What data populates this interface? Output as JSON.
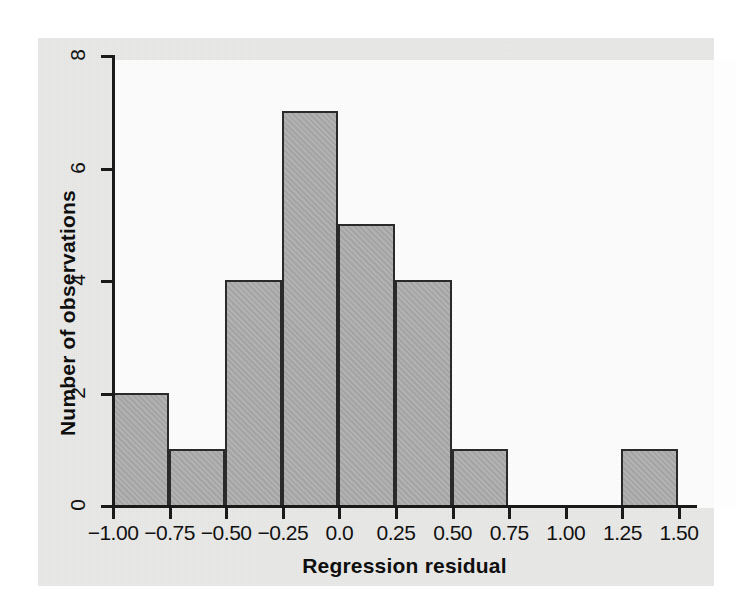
{
  "figure": {
    "background_color": "#e9e9e7",
    "plot_background_color": "#fdfdfd",
    "bar_fill_color": "#a9a9a9",
    "bar_edge_color": "#2a2a2a",
    "axis_color": "#1a1a1a"
  },
  "axes": {
    "x_title": "Regression residual",
    "y_title": "Number of observations",
    "x_tick_labels": [
      "−1.00",
      "−0.75",
      "−0.50",
      "−0.25",
      "0.0",
      "0.25",
      "0.50",
      "0.75",
      "1.00",
      "1.25",
      "1.50"
    ],
    "y_tick_labels": [
      "0",
      "2",
      "4",
      "6",
      "8"
    ]
  },
  "chart_data": {
    "type": "bar",
    "chart_subtype": "histogram",
    "title": "",
    "subtitle": "",
    "xlabel": "Regression residual",
    "ylabel": "Number of observations",
    "xlim": [
      -1.0,
      1.5
    ],
    "ylim": [
      0,
      8
    ],
    "xticks": [
      -1.0,
      -0.75,
      -0.5,
      -0.25,
      0.0,
      0.25,
      0.5,
      0.75,
      1.0,
      1.25,
      1.5
    ],
    "xtick_labels": [
      "−1.00",
      "−0.75",
      "−0.50",
      "−0.25",
      "0.0",
      "0.25",
      "0.50",
      "0.75",
      "1.00",
      "1.25",
      "1.50"
    ],
    "yticks": [
      0,
      2,
      4,
      6,
      8
    ],
    "ytick_labels": [
      "0",
      "2",
      "4",
      "6",
      "8"
    ],
    "grid": false,
    "legend": null,
    "bin_width": 0.25,
    "bin_edges": [
      -1.0,
      -0.75,
      -0.5,
      -0.25,
      0.0,
      0.25,
      0.5,
      0.75,
      1.0,
      1.25,
      1.5
    ],
    "categories": [
      "[-1.00, -0.75)",
      "[-0.75, -0.50)",
      "[-0.50, -0.25)",
      "[-0.25, 0.00)",
      "[0.00, 0.25)",
      "[0.25, 0.50)",
      "[0.50, 0.75)",
      "[0.75, 1.00)",
      "[1.00, 1.25)",
      "[1.25, 1.50)"
    ],
    "values": [
      2,
      1,
      4,
      7,
      5,
      4,
      1,
      0,
      0,
      1
    ],
    "total_observations": 25,
    "bars": [
      {
        "bin_start": -1.0,
        "bin_end": -0.75,
        "count": 2
      },
      {
        "bin_start": -0.75,
        "bin_end": -0.5,
        "count": 1
      },
      {
        "bin_start": -0.5,
        "bin_end": -0.25,
        "count": 4
      },
      {
        "bin_start": -0.25,
        "bin_end": 0.0,
        "count": 7
      },
      {
        "bin_start": 0.0,
        "bin_end": 0.25,
        "count": 5
      },
      {
        "bin_start": 0.25,
        "bin_end": 0.5,
        "count": 4
      },
      {
        "bin_start": 0.5,
        "bin_end": 0.75,
        "count": 1
      },
      {
        "bin_start": 0.75,
        "bin_end": 1.0,
        "count": 0
      },
      {
        "bin_start": 1.0,
        "bin_end": 1.25,
        "count": 0
      },
      {
        "bin_start": 1.25,
        "bin_end": 1.5,
        "count": 1
      }
    ]
  }
}
